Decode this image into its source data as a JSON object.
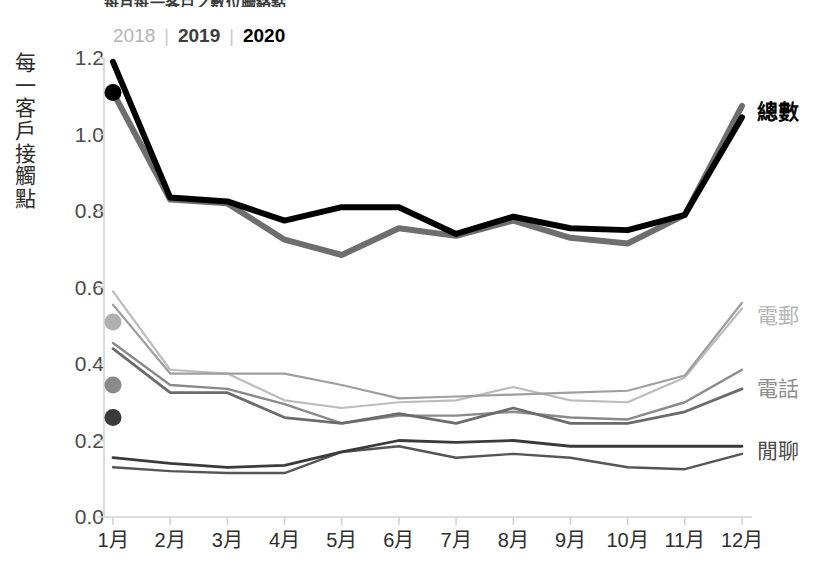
{
  "title_fragment": "每月每一客戶之數位聯絡點",
  "legend": {
    "items": [
      {
        "label": "2018",
        "color": "#b3b3b3",
        "weight": "normal"
      },
      {
        "label": "2019",
        "color": "#3d3d3d",
        "weight": "bold"
      },
      {
        "label": "2020",
        "color": "#000000",
        "weight": "bold"
      }
    ],
    "separator": "|"
  },
  "y_axis_title_chars": [
    "每",
    "一",
    "客",
    "戶",
    "接",
    "觸",
    "點"
  ],
  "series_labels": [
    {
      "name": "total",
      "text": "總數",
      "color": "#000000",
      "weight": "bold",
      "x": 757,
      "y": 101
    },
    {
      "name": "email",
      "text": "電郵",
      "color": "#b6b6b6",
      "weight": "normal",
      "x": 757,
      "y": 305
    },
    {
      "name": "phone",
      "text": "電話",
      "color": "#8c8c8c",
      "weight": "normal",
      "x": 757,
      "y": 378
    },
    {
      "name": "chat",
      "text": "閒聊",
      "color": "#4a4a4a",
      "weight": "normal",
      "x": 757,
      "y": 440
    }
  ],
  "chart_data": {
    "type": "line",
    "title": "每月每一客戶之數位聯絡點",
    "xlabel": "",
    "ylabel": "每一客戶接觸點",
    "ylim": [
      0.0,
      1.2
    ],
    "ytick_values": [
      0.0,
      0.2,
      0.4,
      0.6,
      0.8,
      1.0,
      1.2
    ],
    "ytick_labels": [
      "0.0",
      "0.2",
      "0.4",
      "0.6",
      "0.8",
      "1.0",
      "1.2"
    ],
    "grid": false,
    "legend_position": "top-left",
    "categories": [
      "1月",
      "2月",
      "3月",
      "4月",
      "5月",
      "6月",
      "7月",
      "8月",
      "9月",
      "10月",
      "11月",
      "12月"
    ],
    "groups": [
      {
        "group": "總數",
        "label_color": "#000000",
        "series": [
          {
            "name": "總數 2018",
            "year": "2018",
            "color": "#9a9a9a",
            "width": 3.5,
            "marker_month": 1,
            "marker_value": 1.11,
            "marker_color": "#000000",
            "values": [
              null,
              null,
              null,
              null,
              null,
              null,
              null,
              null,
              null,
              null,
              null,
              null
            ]
          },
          {
            "name": "總數 2019",
            "year": "2019",
            "color": "#6e6e6e",
            "width": 6,
            "values": [
              1.11,
              0.83,
              0.82,
              0.725,
              0.685,
              0.755,
              0.735,
              0.775,
              0.73,
              0.715,
              0.79,
              1.075
            ]
          },
          {
            "name": "總數 2020",
            "year": "2020",
            "color": "#000000",
            "width": 6,
            "values": [
              1.19,
              0.835,
              0.825,
              0.775,
              0.81,
              0.81,
              0.74,
              0.785,
              0.755,
              0.75,
              0.79,
              1.045
            ]
          }
        ]
      },
      {
        "group": "電郵",
        "label_color": "#b6b6b6",
        "series": [
          {
            "name": "電郵 2018",
            "year": "2018",
            "color": "#bcbcbc",
            "width": 2.2,
            "marker_month": 1,
            "marker_value": 0.51,
            "marker_color": "#b0b0b0",
            "values": [
              0.59,
              0.385,
              0.375,
              0.305,
              0.285,
              0.3,
              0.305,
              0.34,
              0.305,
              0.3,
              0.365,
              0.545
            ]
          },
          {
            "name": "電郵 2019",
            "year": "2019",
            "color": "#9e9e9e",
            "width": 2.2,
            "values": [
              0.555,
              0.375,
              0.375,
              0.375,
              0.345,
              0.31,
              0.315,
              0.32,
              0.325,
              0.33,
              0.37,
              0.56
            ]
          }
        ]
      },
      {
        "group": "電話",
        "label_color": "#8c8c8c",
        "series": [
          {
            "name": "電話 2018",
            "year": "2018",
            "color": "#8a8a8a",
            "width": 2.4,
            "marker_month": 1,
            "marker_value": 0.345,
            "marker_color": "#8a8a8a",
            "values": [
              0.455,
              0.345,
              0.335,
              0.295,
              0.245,
              0.265,
              0.265,
              0.275,
              0.26,
              0.255,
              0.3,
              0.385
            ]
          },
          {
            "name": "電話 2019",
            "year": "2019",
            "color": "#6b6b6b",
            "width": 2.8,
            "values": [
              0.44,
              0.325,
              0.325,
              0.26,
              0.245,
              0.27,
              0.245,
              0.285,
              0.245,
              0.245,
              0.275,
              0.335
            ]
          }
        ]
      },
      {
        "group": "閒聊",
        "label_color": "#4a4a4a",
        "series": [
          {
            "name": "閒聊 2018",
            "year": "2018",
            "color": "#555555",
            "width": 2.4,
            "marker_month": 1,
            "marker_value": 0.26,
            "marker_color": "#3a3a3a",
            "values": [
              0.13,
              0.12,
              0.115,
              0.115,
              0.17,
              0.185,
              0.155,
              0.165,
              0.155,
              0.13,
              0.125,
              0.165
            ]
          },
          {
            "name": "閒聊 2019",
            "year": "2019",
            "color": "#3a3a3a",
            "width": 2.8,
            "values": [
              0.155,
              0.14,
              0.13,
              0.135,
              0.17,
              0.2,
              0.195,
              0.2,
              0.185,
              0.185,
              0.185,
              0.185
            ]
          }
        ]
      }
    ]
  },
  "plot_geometry": {
    "x_first": 113,
    "x_last": 742,
    "y_top": 58,
    "y_bottom": 517,
    "axis_color": "#d2d2d2"
  }
}
